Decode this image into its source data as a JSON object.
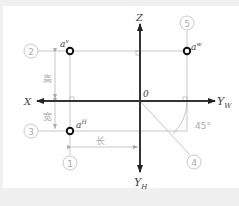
{
  "diagram": {
    "title": "",
    "axes": {
      "x": "X",
      "z": "Z",
      "origin": "0",
      "yw": {
        "base": "Y",
        "sub": "W"
      },
      "yh": {
        "base": "Y",
        "sub": "H"
      }
    },
    "points": {
      "av": {
        "base": "a",
        "sup": "v"
      },
      "aw": {
        "base": "a",
        "sup": "w"
      },
      "ah": {
        "base": "a",
        "sup": "H"
      }
    },
    "callouts": [
      "1",
      "2",
      "3",
      "4",
      "5"
    ],
    "dimensions": {
      "height": "高",
      "width": "宽",
      "length": "长"
    },
    "angle": "45°",
    "colors": {
      "background": "#f0f0f0",
      "panel": "#ffffff",
      "axis": "#333333",
      "thin_line": "#b8b8b8",
      "label": "#aaaaaa"
    }
  }
}
